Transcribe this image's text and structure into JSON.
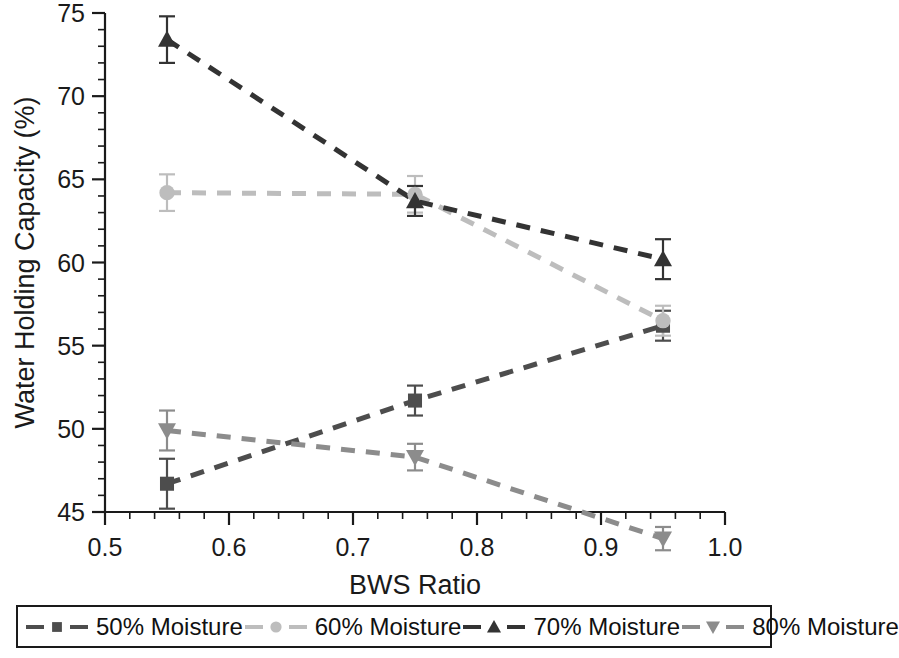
{
  "chart_data": {
    "type": "line",
    "title": "",
    "xlabel": "BWS Ratio",
    "ylabel": "Water Holding Capacity (%)",
    "xlim": [
      0.5,
      1.0
    ],
    "ylim": [
      45,
      75
    ],
    "x": [
      0.55,
      0.75,
      0.95
    ],
    "xticks": [
      "0.5",
      "0.6",
      "0.7",
      "0.8",
      "0.9",
      "1.0"
    ],
    "xtick_values": [
      0.5,
      0.6,
      0.7,
      0.8,
      0.9,
      1.0
    ],
    "yticks": [
      "45",
      "50",
      "55",
      "60",
      "65",
      "70",
      "75"
    ],
    "ytick_values": [
      45,
      50,
      55,
      60,
      65,
      70,
      75
    ],
    "x_minor_step": 0.02,
    "y_minor_step": 1,
    "grid": false,
    "legend_position": "below",
    "linestyle": "dashed",
    "series": [
      {
        "name": "50% Moisture",
        "marker": "square",
        "color": "#4d4d4d",
        "values": [
          46.7,
          51.7,
          56.2
        ],
        "errors": [
          1.5,
          0.9,
          0.9
        ]
      },
      {
        "name": "60% Moisture",
        "marker": "circle",
        "color": "#bdbdbd",
        "values": [
          64.2,
          64.1,
          56.5
        ],
        "errors": [
          1.1,
          1.1,
          0.9
        ]
      },
      {
        "name": "70% Moisture",
        "marker": "triangle-up",
        "color": "#333333",
        "values": [
          73.4,
          63.7,
          60.2
        ],
        "errors": [
          1.4,
          0.9,
          1.2
        ]
      },
      {
        "name": "80% Moisture",
        "marker": "triangle-down",
        "color": "#8c8c8c",
        "values": [
          49.9,
          48.3,
          43.4
        ],
        "errors": [
          1.2,
          0.8,
          0.7
        ]
      }
    ]
  },
  "legend": {
    "items": [
      {
        "label": "50% Moisture"
      },
      {
        "label": "60% Moisture"
      },
      {
        "label": "70% Moisture"
      },
      {
        "label": "80% Moisture"
      }
    ]
  }
}
